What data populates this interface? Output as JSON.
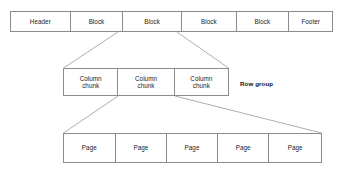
{
  "diagram": {
    "line_color": "#8c8c8c",
    "text_color": "#1a1a1a",
    "background": "#ffffff",
    "tiers": [
      {
        "name": "file-blocks",
        "cells": [
          {
            "label": "Header"
          },
          {
            "label": "Block"
          },
          {
            "label": "Block"
          },
          {
            "label": "Block"
          },
          {
            "label": "Block"
          },
          {
            "label": "Footer"
          }
        ]
      },
      {
        "name": "column-chunks",
        "cells": [
          {
            "line1": "Column",
            "line2": "chunk"
          },
          {
            "line1": "Column",
            "line2": "chunk"
          },
          {
            "line1": "Column",
            "line2": "chunk"
          }
        ]
      },
      {
        "name": "pages",
        "cells": [
          {
            "label": "Page"
          },
          {
            "label": "Page"
          },
          {
            "label": "Page"
          },
          {
            "label": "Page"
          },
          {
            "label": "Page"
          }
        ]
      }
    ],
    "annotations": [
      {
        "name": "row-group",
        "label": "Row group"
      }
    ]
  }
}
